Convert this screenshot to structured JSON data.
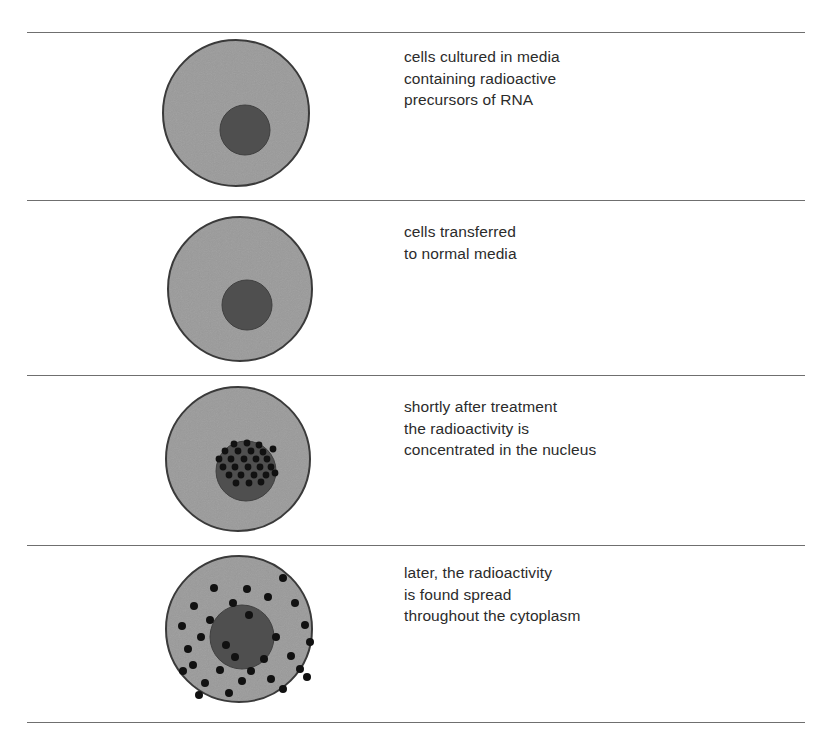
{
  "figure": {
    "background_color": "#ffffff",
    "divider_color": "#6f6f6f",
    "text_color": "#2b2b2b"
  },
  "colors": {
    "cytoplasm_fill": "#9a9a9a",
    "cytoplasm_stroke": "#3a3a3a",
    "nucleus_fill": "#4f4f4f",
    "nucleus_stroke": "#3f3f3f",
    "grain_fill": "#111111"
  },
  "dividers": [
    {
      "name": "divider-top",
      "y": 32
    },
    {
      "name": "divider-1",
      "y": 200
    },
    {
      "name": "divider-2",
      "y": 375
    },
    {
      "name": "divider-3",
      "y": 545
    },
    {
      "name": "divider-bottom",
      "y": 722
    }
  ],
  "panels": [
    {
      "id": "panel-1",
      "step": 1,
      "caption": "cells cultured in media\ncontaining radioactive\nprecursors of RNA",
      "caption_x": 404,
      "caption_y": 46,
      "cell": {
        "box": {
          "x": 160,
          "y": 38,
          "w": 152,
          "h": 150
        },
        "cytoplasm": {
          "cx": 76,
          "cy": 75,
          "r": 73
        },
        "nucleus": {
          "cx": 85,
          "cy": 92,
          "r": 25
        },
        "grains": []
      }
    },
    {
      "id": "panel-2",
      "step": 2,
      "caption": "cells transferred\nto normal media",
      "caption_x": 404,
      "caption_y": 221,
      "cell": {
        "box": {
          "x": 165,
          "y": 215,
          "w": 150,
          "h": 148
        },
        "cytoplasm": {
          "cx": 75,
          "cy": 74,
          "r": 72
        },
        "nucleus": {
          "cx": 82,
          "cy": 90,
          "r": 25
        },
        "grains": []
      }
    },
    {
      "id": "panel-3",
      "step": 3,
      "caption": "shortly after treatment\nthe radioactivity is\nconcentrated in the nucleus",
      "caption_x": 404,
      "caption_y": 396,
      "cell": {
        "box": {
          "x": 163,
          "y": 385,
          "w": 150,
          "h": 148
        },
        "cytoplasm": {
          "cx": 75,
          "cy": 74,
          "r": 72
        },
        "nucleus": {
          "cx": 83,
          "cy": 86,
          "r": 30
        },
        "grain_radius": 3.4,
        "grains": [
          [
            71,
            59
          ],
          [
            84,
            58
          ],
          [
            96,
            60
          ],
          [
            62,
            66
          ],
          [
            75,
            66
          ],
          [
            88,
            66
          ],
          [
            100,
            67
          ],
          [
            110,
            64
          ],
          [
            56,
            74
          ],
          [
            68,
            74
          ],
          [
            81,
            74
          ],
          [
            93,
            74
          ],
          [
            104,
            74
          ],
          [
            60,
            82
          ],
          [
            72,
            82
          ],
          [
            85,
            82
          ],
          [
            97,
            82
          ],
          [
            108,
            82
          ],
          [
            66,
            90
          ],
          [
            78,
            90
          ],
          [
            91,
            90
          ],
          [
            103,
            90
          ],
          [
            112,
            88
          ],
          [
            73,
            98
          ],
          [
            86,
            98
          ],
          [
            98,
            97
          ]
        ]
      }
    },
    {
      "id": "panel-4",
      "step": 4,
      "caption": "later, the radioactivity\nis found spread\nthroughout the cytoplasm",
      "caption_x": 404,
      "caption_y": 562,
      "cell": {
        "box": {
          "x": 163,
          "y": 553,
          "w": 152,
          "h": 150
        },
        "cytoplasm": {
          "cx": 76,
          "cy": 76,
          "r": 73
        },
        "nucleus": {
          "cx": 79,
          "cy": 84,
          "r": 32
        },
        "grain_radius": 4.0,
        "grains": [
          [
            51,
            35
          ],
          [
            84,
            36
          ],
          [
            120,
            25
          ],
          [
            31,
            53
          ],
          [
            70,
            50
          ],
          [
            105,
            44
          ],
          [
            132,
            50
          ],
          [
            19,
            73
          ],
          [
            47,
            67
          ],
          [
            86,
            62
          ],
          [
            38,
            84
          ],
          [
            142,
            72
          ],
          [
            25,
            96
          ],
          [
            63,
            92
          ],
          [
            113,
            84
          ],
          [
            147,
            89
          ],
          [
            30,
            112
          ],
          [
            72,
            104
          ],
          [
            101,
            106
          ],
          [
            128,
            103
          ],
          [
            20,
            118
          ],
          [
            57,
            117
          ],
          [
            88,
            118
          ],
          [
            137,
            116
          ],
          [
            42,
            130
          ],
          [
            79,
            128
          ],
          [
            108,
            126
          ],
          [
            144,
            124
          ],
          [
            36,
            142
          ],
          [
            66,
            140
          ],
          [
            120,
            136
          ]
        ]
      }
    }
  ]
}
